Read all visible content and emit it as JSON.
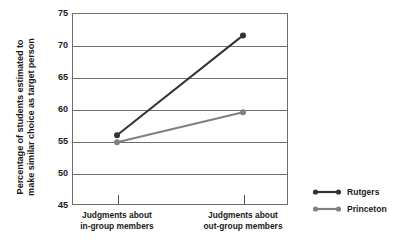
{
  "chart_data": {
    "type": "line",
    "title": "",
    "xlabel": "",
    "ylabel_line1": "Percentage of students estimated to",
    "ylabel_line2": "make similar choice as target person",
    "categories": [
      "Judgments about in-group members",
      "Judgments about out-group members"
    ],
    "category_labels": [
      {
        "line1": "Judgments about",
        "line2": "in-group members"
      },
      {
        "line1": "Judgments about",
        "line2": "out-group members"
      }
    ],
    "series": [
      {
        "name": "Rutgers",
        "values": [
          55.9,
          71.5
        ],
        "color": "#333333"
      },
      {
        "name": "Princeton",
        "values": [
          54.8,
          59.5
        ],
        "color": "#808080"
      }
    ],
    "ylim": [
      45,
      75
    ],
    "yticks": [
      75,
      70,
      65,
      60,
      55,
      50,
      45
    ],
    "ytick_labels": [
      "75",
      "70",
      "65",
      "60",
      "55",
      "50",
      "45"
    ],
    "grid": true,
    "legend_position": "right",
    "legend_entries": [
      {
        "label": "Rutgers",
        "color": "#333333"
      },
      {
        "label": "Princeton",
        "color": "#808080"
      }
    ],
    "axis_color": "#6e6e6e",
    "background": "#ffffff"
  }
}
